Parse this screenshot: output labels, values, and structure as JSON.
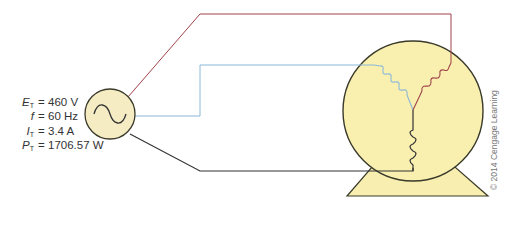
{
  "source": {
    "label": "AC source",
    "symbol": "sine-wave",
    "parameters": [
      {
        "symbol": "E",
        "subscript": "T",
        "equals": "=",
        "value": "460 V"
      },
      {
        "symbol": "f",
        "subscript": "",
        "equals": "=",
        "value": "60 Hz"
      },
      {
        "symbol": "I",
        "subscript": "T",
        "equals": "=",
        "value": "3.4 A"
      },
      {
        "symbol": "P",
        "subscript": "T",
        "equals": "=",
        "value": "1706.57 W"
      }
    ]
  },
  "motor": {
    "label": "three-phase wye-connected motor",
    "windings": [
      "blue",
      "red",
      "black"
    ]
  },
  "wires": {
    "red": "#a0424a",
    "blue": "#8ab8d8",
    "black": "#333333"
  },
  "colors": {
    "fill": "#f9f0b0",
    "source_fill": "#f5ecc4",
    "outline": "#3a3a2a",
    "base_fill": "#f7eeaf"
  },
  "copyright": "© 2014 Cengage Learning"
}
